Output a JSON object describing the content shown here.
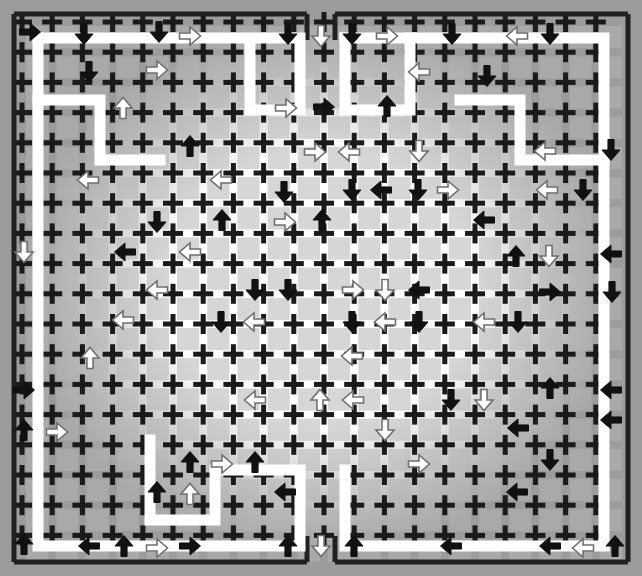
{
  "figure": {
    "title": "Cross-lattice arrow field",
    "width": 642,
    "height": 576,
    "background_color": "#ffffff"
  },
  "colors": {
    "cross": "#1a1a1a",
    "frame": "#202020",
    "vignette_gray": "#9c9c9c",
    "cell_gray": "#b4b4b4",
    "arrow_black": "#111111",
    "arrow_white_fill": "#ffffff",
    "arrow_white_stroke": "#6f6f6f",
    "path_band": "#ffffff"
  },
  "lattice": {
    "origin_x": 22,
    "origin_y": 22,
    "pitch_x": 30.2,
    "pitch_y": 30.2,
    "columns": 20,
    "rows": 18,
    "cross_arm": 10,
    "cross_thickness": 5
  },
  "frame": {
    "left": 14,
    "top": 14,
    "right": 628,
    "bottom": 562,
    "thickness": 5,
    "notch_top": {
      "x": 307,
      "width": 28
    },
    "notch_bottom": {
      "x": 307,
      "width": 28
    },
    "notch_label": "gap-in-border"
  },
  "path_band": {
    "description": "white corridor inset one cell inside the frame, meandering inward",
    "stroke_width": 11
  },
  "arrows": {
    "glyph_black": "⬇",
    "glyph_white": "⇩",
    "count_black": 78,
    "count_white": 62,
    "size": 21,
    "directions": [
      "up",
      "down",
      "left",
      "right"
    ],
    "items": [
      {
        "x": 30,
        "y": 32,
        "d": "right",
        "c": "black"
      },
      {
        "x": 84,
        "y": 34,
        "d": "down",
        "c": "black"
      },
      {
        "x": 159,
        "y": 32,
        "d": "down",
        "c": "black"
      },
      {
        "x": 190,
        "y": 36,
        "d": "right",
        "c": "white"
      },
      {
        "x": 288,
        "y": 34,
        "d": "down",
        "c": "black"
      },
      {
        "x": 321,
        "y": 36,
        "d": "down",
        "c": "white"
      },
      {
        "x": 352,
        "y": 34,
        "d": "down",
        "c": "black"
      },
      {
        "x": 387,
        "y": 36,
        "d": "right",
        "c": "white"
      },
      {
        "x": 452,
        "y": 34,
        "d": "down",
        "c": "black"
      },
      {
        "x": 517,
        "y": 36,
        "d": "left",
        "c": "white"
      },
      {
        "x": 550,
        "y": 34,
        "d": "down",
        "c": "black"
      },
      {
        "x": 89,
        "y": 72,
        "d": "down",
        "c": "black"
      },
      {
        "x": 157,
        "y": 70,
        "d": "right",
        "c": "white"
      },
      {
        "x": 419,
        "y": 72,
        "d": "left",
        "c": "white"
      },
      {
        "x": 487,
        "y": 76,
        "d": "down",
        "c": "black"
      },
      {
        "x": 123,
        "y": 108,
        "d": "up",
        "c": "white"
      },
      {
        "x": 286,
        "y": 108,
        "d": "right",
        "c": "white"
      },
      {
        "x": 324,
        "y": 107,
        "d": "right",
        "c": "black"
      },
      {
        "x": 387,
        "y": 106,
        "d": "up",
        "c": "black"
      },
      {
        "x": 190,
        "y": 146,
        "d": "up",
        "c": "black"
      },
      {
        "x": 315,
        "y": 152,
        "d": "right",
        "c": "white"
      },
      {
        "x": 349,
        "y": 152,
        "d": "left",
        "c": "white"
      },
      {
        "x": 419,
        "y": 151,
        "d": "down",
        "c": "white"
      },
      {
        "x": 545,
        "y": 151,
        "d": "left",
        "c": "white"
      },
      {
        "x": 611,
        "y": 150,
        "d": "down",
        "c": "black"
      },
      {
        "x": 88,
        "y": 180,
        "d": "left",
        "c": "white"
      },
      {
        "x": 221,
        "y": 180,
        "d": "left",
        "c": "white"
      },
      {
        "x": 284,
        "y": 192,
        "d": "down",
        "c": "black"
      },
      {
        "x": 352,
        "y": 190,
        "d": "down",
        "c": "black"
      },
      {
        "x": 381,
        "y": 190,
        "d": "left",
        "c": "black"
      },
      {
        "x": 418,
        "y": 190,
        "d": "down",
        "c": "black"
      },
      {
        "x": 448,
        "y": 190,
        "d": "right",
        "c": "white"
      },
      {
        "x": 547,
        "y": 190,
        "d": "left",
        "c": "white"
      },
      {
        "x": 583,
        "y": 190,
        "d": "down",
        "c": "black"
      },
      {
        "x": 157,
        "y": 222,
        "d": "down",
        "c": "black"
      },
      {
        "x": 222,
        "y": 220,
        "d": "up",
        "c": "black"
      },
      {
        "x": 285,
        "y": 222,
        "d": "right",
        "c": "white"
      },
      {
        "x": 322,
        "y": 220,
        "d": "up",
        "c": "black"
      },
      {
        "x": 484,
        "y": 220,
        "d": "left",
        "c": "black"
      },
      {
        "x": 24,
        "y": 252,
        "d": "down",
        "c": "white"
      },
      {
        "x": 125,
        "y": 252,
        "d": "left",
        "c": "black"
      },
      {
        "x": 190,
        "y": 252,
        "d": "left",
        "c": "white"
      },
      {
        "x": 516,
        "y": 256,
        "d": "up",
        "c": "black"
      },
      {
        "x": 549,
        "y": 256,
        "d": "down",
        "c": "white"
      },
      {
        "x": 611,
        "y": 254,
        "d": "left",
        "c": "black"
      },
      {
        "x": 157,
        "y": 290,
        "d": "left",
        "c": "white"
      },
      {
        "x": 255,
        "y": 290,
        "d": "down",
        "c": "black"
      },
      {
        "x": 288,
        "y": 290,
        "d": "down",
        "c": "black"
      },
      {
        "x": 353,
        "y": 290,
        "d": "right",
        "c": "white"
      },
      {
        "x": 385,
        "y": 290,
        "d": "down",
        "c": "white"
      },
      {
        "x": 419,
        "y": 290,
        "d": "left",
        "c": "black"
      },
      {
        "x": 550,
        "y": 292,
        "d": "right",
        "c": "black"
      },
      {
        "x": 612,
        "y": 292,
        "d": "down",
        "c": "black"
      },
      {
        "x": 123,
        "y": 320,
        "d": "left",
        "c": "white"
      },
      {
        "x": 221,
        "y": 322,
        "d": "down",
        "c": "black"
      },
      {
        "x": 254,
        "y": 322,
        "d": "left",
        "c": "white"
      },
      {
        "x": 352,
        "y": 322,
        "d": "down",
        "c": "black"
      },
      {
        "x": 385,
        "y": 322,
        "d": "left",
        "c": "white"
      },
      {
        "x": 419,
        "y": 322,
        "d": "down",
        "c": "black"
      },
      {
        "x": 484,
        "y": 322,
        "d": "left",
        "c": "white"
      },
      {
        "x": 518,
        "y": 322,
        "d": "down",
        "c": "black"
      },
      {
        "x": 90,
        "y": 358,
        "d": "up",
        "c": "white"
      },
      {
        "x": 352,
        "y": 356,
        "d": "left",
        "c": "white"
      },
      {
        "x": 24,
        "y": 390,
        "d": "right",
        "c": "black"
      },
      {
        "x": 550,
        "y": 388,
        "d": "up",
        "c": "black"
      },
      {
        "x": 611,
        "y": 390,
        "d": "left",
        "c": "black"
      },
      {
        "x": 255,
        "y": 400,
        "d": "left",
        "c": "white"
      },
      {
        "x": 320,
        "y": 400,
        "d": "up",
        "c": "white"
      },
      {
        "x": 353,
        "y": 400,
        "d": "left",
        "c": "white"
      },
      {
        "x": 451,
        "y": 400,
        "d": "down",
        "c": "black"
      },
      {
        "x": 484,
        "y": 400,
        "d": "down",
        "c": "white"
      },
      {
        "x": 611,
        "y": 420,
        "d": "left",
        "c": "black"
      },
      {
        "x": 24,
        "y": 430,
        "d": "up",
        "c": "black"
      },
      {
        "x": 57,
        "y": 432,
        "d": "right",
        "c": "white"
      },
      {
        "x": 385,
        "y": 430,
        "d": "down",
        "c": "white"
      },
      {
        "x": 518,
        "y": 428,
        "d": "left",
        "c": "black"
      },
      {
        "x": 190,
        "y": 462,
        "d": "up",
        "c": "black"
      },
      {
        "x": 222,
        "y": 464,
        "d": "right",
        "c": "white"
      },
      {
        "x": 255,
        "y": 462,
        "d": "up",
        "c": "black"
      },
      {
        "x": 419,
        "y": 464,
        "d": "right",
        "c": "white"
      },
      {
        "x": 550,
        "y": 460,
        "d": "down",
        "c": "black"
      },
      {
        "x": 157,
        "y": 492,
        "d": "up",
        "c": "black"
      },
      {
        "x": 190,
        "y": 494,
        "d": "up",
        "c": "white"
      },
      {
        "x": 285,
        "y": 492,
        "d": "left",
        "c": "black"
      },
      {
        "x": 517,
        "y": 492,
        "d": "left",
        "c": "black"
      },
      {
        "x": 24,
        "y": 544,
        "d": "up",
        "c": "black"
      },
      {
        "x": 89,
        "y": 546,
        "d": "left",
        "c": "black"
      },
      {
        "x": 124,
        "y": 546,
        "d": "up",
        "c": "black"
      },
      {
        "x": 157,
        "y": 548,
        "d": "right",
        "c": "white"
      },
      {
        "x": 190,
        "y": 546,
        "d": "right",
        "c": "black"
      },
      {
        "x": 288,
        "y": 546,
        "d": "up",
        "c": "black"
      },
      {
        "x": 321,
        "y": 546,
        "d": "down",
        "c": "white"
      },
      {
        "x": 354,
        "y": 546,
        "d": "up",
        "c": "black"
      },
      {
        "x": 451,
        "y": 546,
        "d": "left",
        "c": "black"
      },
      {
        "x": 550,
        "y": 546,
        "d": "left",
        "c": "black"
      },
      {
        "x": 583,
        "y": 548,
        "d": "left",
        "c": "white"
      },
      {
        "x": 615,
        "y": 546,
        "d": "up",
        "c": "black"
      }
    ]
  }
}
